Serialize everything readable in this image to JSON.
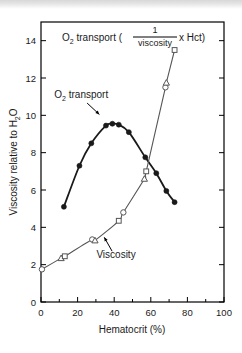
{
  "figure": {
    "name": "hematocrit-viscosity-o2transport-figure",
    "background_color": "#ffffff",
    "frame_color": "#000000"
  },
  "chart_data": {
    "type": "line",
    "title_parts": {
      "lead": "O",
      "lead_sub": "2",
      "lead_tail": " transport (",
      "fraction_numerator": "1",
      "fraction_denominator": "viscosity",
      "tail": " x Hct)"
    },
    "xlabel": "Hematocrit (%)",
    "ylabel": "Viscosity relative to H2O",
    "ylabel_parts": {
      "lead": "Viscosity relative to H",
      "sub": "2",
      "tail": "O"
    },
    "xlim": [
      0,
      100
    ],
    "ylim": [
      0,
      15
    ],
    "xticks": [
      0,
      20,
      40,
      60,
      80,
      100
    ],
    "xtick_labels": [
      "0",
      "20",
      "40",
      "60",
      "80",
      "100"
    ],
    "xminor_ticks": [
      10,
      30,
      50,
      70,
      90
    ],
    "yticks": [
      0,
      2,
      4,
      6,
      8,
      10,
      12,
      14
    ],
    "ytick_labels": [
      "0",
      "2",
      "4",
      "6",
      "8",
      "10",
      "12",
      "14"
    ],
    "grid": false,
    "legend_position": "in-plot-annotations",
    "series": [
      {
        "name": "O2 transport",
        "marker": "filled-circle",
        "color": "#1a1a1a",
        "line_width": 1.8,
        "points": [
          {
            "x": 12.5,
            "y": 5.1
          },
          {
            "x": 21.0,
            "y": 7.3
          },
          {
            "x": 27.5,
            "y": 8.5
          },
          {
            "x": 35.5,
            "y": 9.45
          },
          {
            "x": 39.0,
            "y": 9.55
          },
          {
            "x": 42.5,
            "y": 9.5
          },
          {
            "x": 48.0,
            "y": 9.1
          },
          {
            "x": 57.0,
            "y": 7.75
          },
          {
            "x": 63.0,
            "y": 6.9
          },
          {
            "x": 68.5,
            "y": 5.95
          },
          {
            "x": 73.0,
            "y": 5.35
          }
        ]
      },
      {
        "name": "Viscosity",
        "marker": "mixed-open-circle-triangle-square",
        "color": "#555555",
        "line_width": 1.1,
        "points": [
          {
            "x": 0.5,
            "y": 1.75
          },
          {
            "x": 11.0,
            "y": 2.35
          },
          {
            "x": 13.0,
            "y": 2.45
          },
          {
            "x": 28.0,
            "y": 3.35
          },
          {
            "x": 29.5,
            "y": 3.3
          },
          {
            "x": 42.5,
            "y": 4.35
          },
          {
            "x": 45.0,
            "y": 4.8
          },
          {
            "x": 56.5,
            "y": 6.6
          },
          {
            "x": 57.5,
            "y": 7.0
          },
          {
            "x": 68.0,
            "y": 11.5
          },
          {
            "x": 68.5,
            "y": 11.75
          },
          {
            "x": 73.0,
            "y": 13.5
          }
        ]
      }
    ],
    "annotations": [
      {
        "name": "o2-transport-label",
        "text": "O2 transport",
        "text_parts": {
          "lead": "O",
          "sub": "2",
          "tail": " transport"
        },
        "x": 22.0,
        "y": 10.95,
        "arrow_to_x": 33.5,
        "arrow_to_y": 9.9
      },
      {
        "name": "viscosity-label",
        "text": "Viscosity",
        "text_parts": {
          "lead": "Viscosity",
          "sub": "",
          "tail": ""
        },
        "x": 41.0,
        "y": 2.35,
        "arrow_to_x": 33.5,
        "arrow_to_y": 3.65
      }
    ]
  }
}
